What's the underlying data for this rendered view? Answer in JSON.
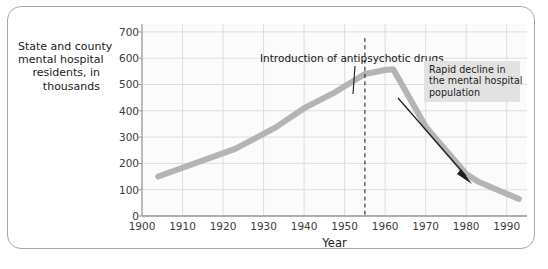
{
  "chart_data": {
    "type": "line",
    "title": "",
    "xlabel": "Year",
    "ylabel": "State and county mental hospital residents, in thousands",
    "ylabel_lines": [
      "State and county",
      "mental hospital",
      "residents, in",
      "thousands"
    ],
    "xlim": [
      1900,
      1995
    ],
    "ylim": [
      0,
      730
    ],
    "xticks": [
      1900,
      1910,
      1920,
      1930,
      1940,
      1950,
      1960,
      1970,
      1980,
      1990
    ],
    "xtick_labels": [
      "1900",
      "1910",
      "1920",
      "1930",
      "1940",
      "1950",
      "1960",
      "1970",
      "1980",
      "1990"
    ],
    "yticks": [
      0,
      100,
      200,
      300,
      400,
      500,
      600,
      700
    ],
    "ytick_labels": [
      "0",
      "100",
      "200",
      "300",
      "400",
      "500",
      "600",
      "700"
    ],
    "grid": true,
    "grid_color": "#dddddd",
    "legend": null,
    "series": [
      {
        "name": "State and county mental hospital residents",
        "color": "#b4b4b4",
        "line_width": 6,
        "x": [
          1904,
          1923,
          1933,
          1940,
          1947,
          1955,
          1960,
          1962,
          1970,
          1980,
          1983,
          1993
        ],
        "values": [
          150,
          255,
          337,
          410,
          465,
          540,
          555,
          558,
          340,
          160,
          130,
          65
        ]
      }
    ],
    "annotations": [
      {
        "name": "introduction-of-antipsychotic-drugs",
        "text": "Introduction of antipsychotic drugs",
        "marker": "dashed-vertical-line",
        "marker_year": 1955
      },
      {
        "name": "rapid-decline",
        "text": "Rapid decline in the mental hospital population",
        "lines": [
          "Rapid decline in",
          "the mental hospital",
          "population"
        ],
        "marker": "arrow",
        "background": "#e2e2e2"
      }
    ]
  },
  "axes": {
    "y": {
      "ticks": [
        {
          "value": 700,
          "label": "700"
        },
        {
          "value": 600,
          "label": "600"
        },
        {
          "value": 500,
          "label": "500"
        },
        {
          "value": 400,
          "label": "400"
        },
        {
          "value": 300,
          "label": "300"
        },
        {
          "value": 200,
          "label": "200"
        },
        {
          "value": 100,
          "label": "100"
        },
        {
          "value": 0,
          "label": "0"
        }
      ]
    },
    "x": {
      "title": "Year",
      "ticks": [
        {
          "value": 1900,
          "label": "1900"
        },
        {
          "value": 1910,
          "label": "1910"
        },
        {
          "value": 1920,
          "label": "1920"
        },
        {
          "value": 1930,
          "label": "1930"
        },
        {
          "value": 1940,
          "label": "1940"
        },
        {
          "value": 1950,
          "label": "1950"
        },
        {
          "value": 1960,
          "label": "1960"
        },
        {
          "value": 1970,
          "label": "1970"
        },
        {
          "value": 1980,
          "label": "1980"
        },
        {
          "value": 1990,
          "label": "1990"
        }
      ]
    }
  },
  "annotations": {
    "intro": {
      "text": "Introduction of antipsychotic drugs"
    },
    "decline": {
      "line1": "Rapid decline in",
      "line2": "the mental hospital",
      "line3": "population"
    }
  },
  "colors": {
    "series_line": "#b4b4b4",
    "grid": "#dddddd",
    "axis": "#9a9a9a",
    "frame": "#a9a6a3",
    "annotation_box": "#e2e2e2",
    "text": "#212121"
  }
}
